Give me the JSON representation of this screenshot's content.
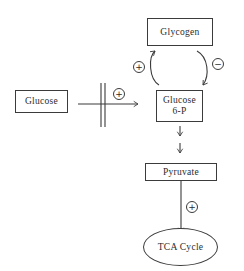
{
  "nodes": {
    "glycogen": {
      "label": "Glycogen"
    },
    "glucose": {
      "label": "Glucose"
    },
    "glucose6p": {
      "line1": "Glucose",
      "line2": "6-P"
    },
    "pyruvate": {
      "label": "Pyruvate"
    },
    "tca_cycle": {
      "label": "TCA Cycle"
    }
  },
  "signs": {
    "glucose_uptake": "+",
    "glycogen_synthesis": "+",
    "glycogen_breakdown": "−",
    "tca_entry": "+"
  },
  "colors": {
    "line": "#3b3b3b",
    "text": "#2b2b2b",
    "background": "#ffffff"
  }
}
